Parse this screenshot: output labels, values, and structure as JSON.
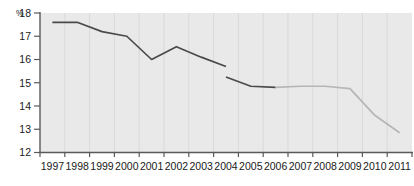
{
  "chart_data": {
    "type": "line",
    "title": "",
    "subtitle": "",
    "xlabel": "",
    "ylabel": "%",
    "ylim": [
      12,
      18
    ],
    "yticks": [
      12,
      13,
      14,
      15,
      16,
      17,
      18
    ],
    "ytick_labels": [
      "12",
      "13",
      "14",
      "15",
      "16",
      "17",
      "18"
    ],
    "grid": false,
    "legend": "none",
    "categories": [
      "1997",
      "1998",
      "1999",
      "2000",
      "2001",
      "2002",
      "2003",
      "2004",
      "2005",
      "2006",
      "2007",
      "2008",
      "2009",
      "2010",
      "2011"
    ],
    "series": [
      {
        "name": "historical",
        "color": "#4a4a4a",
        "style": "solid",
        "segments": [
          {
            "x": [
              "1997",
              "1998",
              "1999",
              "2000",
              "2001",
              "2002",
              "2003",
              "2004"
            ],
            "values": [
              17.6,
              17.6,
              17.2,
              17.0,
              16.0,
              16.55,
              16.1,
              15.7
            ]
          },
          {
            "x": [
              "2004",
              "2005",
              "2006"
            ],
            "values": [
              15.25,
              14.85,
              14.8
            ]
          }
        ]
      },
      {
        "name": "projection",
        "color": "#b6b6b6",
        "style": "solid",
        "segments": [
          {
            "x": [
              "2006",
              "2007",
              "2008",
              "2009",
              "2010",
              "2011"
            ],
            "values": [
              14.8,
              14.85,
              14.85,
              14.75,
              13.6,
              12.85
            ]
          }
        ]
      }
    ]
  },
  "axis": {
    "unit_label": "%"
  }
}
